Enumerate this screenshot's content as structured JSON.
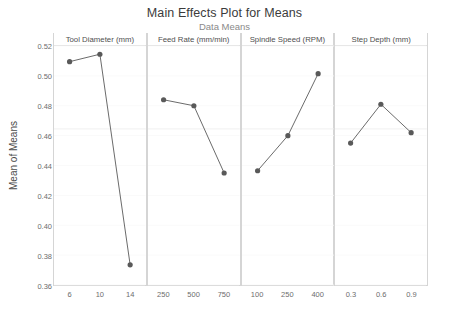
{
  "chart_data": {
    "type": "line",
    "title": "Main Effects Plot for Means",
    "subtitle": "Data Means",
    "ylabel": "Mean of Means",
    "xlabel": "",
    "ylim": [
      0.36,
      0.52
    ],
    "yticks": [
      "0.36",
      "0.38",
      "0.40",
      "0.42",
      "0.44",
      "0.46",
      "0.48",
      "0.50",
      "0.52"
    ],
    "ytick_values": [
      0.36,
      0.38,
      0.4,
      0.42,
      0.44,
      0.46,
      0.48,
      0.5,
      0.52
    ],
    "grid": "horizontal-faint",
    "legend": "none",
    "reference_line": 0.4645,
    "marker_color": "#595959",
    "line_color": "#6b6b6b",
    "panels": [
      {
        "name": "Tool Diameter (mm)",
        "categories": [
          "6",
          "10",
          "14"
        ],
        "values": [
          0.5095,
          0.5145,
          0.3735
        ]
      },
      {
        "name": "Feed Rate (mm/min)",
        "categories": [
          "250",
          "500",
          "750"
        ],
        "values": [
          0.484,
          0.48,
          0.435
        ]
      },
      {
        "name": "Spindle Speed (RPM)",
        "categories": [
          "100",
          "250",
          "400"
        ],
        "values": [
          0.4365,
          0.46,
          0.5015
        ]
      },
      {
        "name": "Step Depth (mm)",
        "categories": [
          "0.3",
          "0.6",
          "0.9"
        ],
        "values": [
          0.455,
          0.481,
          0.462
        ]
      }
    ]
  }
}
